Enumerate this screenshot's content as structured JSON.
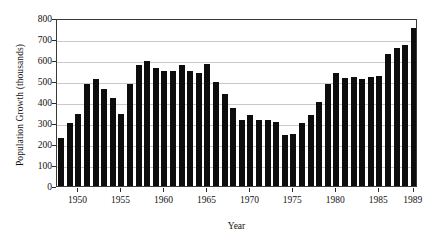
{
  "chart_data": {
    "type": "bar",
    "title": "",
    "xlabel": "Year",
    "ylabel": "Population Growth (thousands)",
    "ylim": [
      0,
      800
    ],
    "xlim": [
      1947.5,
      1989.5
    ],
    "grid": true,
    "legend": null,
    "y_ticks": [
      0,
      100,
      200,
      300,
      400,
      500,
      600,
      700,
      800
    ],
    "y_tick_labels": [
      "0",
      "100",
      "200",
      "300",
      "400",
      "500",
      "600",
      "700",
      "800"
    ],
    "x_tick_labels": [
      "1950",
      "1955",
      "1960",
      "1965",
      "1970",
      "1975",
      "1980",
      "1985",
      "1989"
    ],
    "x_ticks": [
      1950,
      1955,
      1960,
      1965,
      1970,
      1975,
      1980,
      1985,
      1989
    ],
    "bar_color": "#0d0d0d",
    "categories": [
      1948,
      1949,
      1950,
      1951,
      1952,
      1953,
      1954,
      1955,
      1956,
      1957,
      1958,
      1959,
      1960,
      1961,
      1962,
      1963,
      1964,
      1965,
      1966,
      1967,
      1968,
      1969,
      1970,
      1971,
      1972,
      1973,
      1974,
      1975,
      1976,
      1977,
      1978,
      1979,
      1980,
      1981,
      1982,
      1983,
      1984,
      1985,
      1986,
      1987,
      1988,
      1989
    ],
    "values": [
      230,
      300,
      345,
      487,
      510,
      462,
      418,
      345,
      487,
      575,
      597,
      562,
      548,
      549,
      575,
      550,
      540,
      580,
      497,
      440,
      370,
      315,
      340,
      312,
      312,
      305,
      245,
      247,
      300,
      338,
      400,
      487,
      540,
      512,
      518,
      510,
      520,
      524,
      630,
      655,
      670,
      752
    ]
  }
}
